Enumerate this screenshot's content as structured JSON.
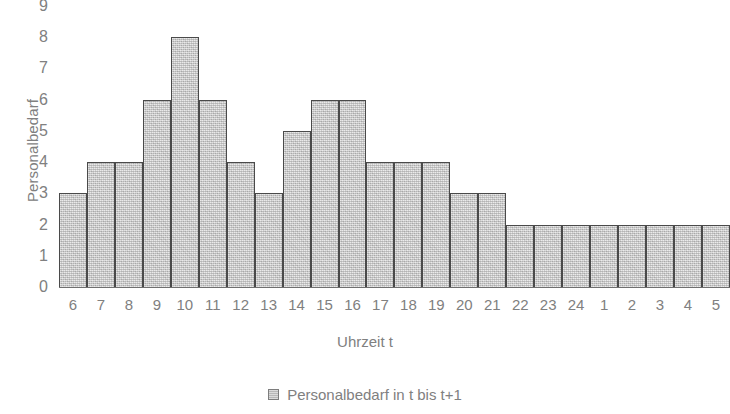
{
  "chart_data": {
    "type": "bar",
    "title": "",
    "xlabel": "Uhrzeit t",
    "ylabel": "Personalbedarf",
    "categories": [
      "6",
      "7",
      "8",
      "9",
      "10",
      "11",
      "12",
      "13",
      "14",
      "15",
      "16",
      "17",
      "18",
      "19",
      "20",
      "21",
      "22",
      "23",
      "24",
      "1",
      "2",
      "3",
      "4",
      "5"
    ],
    "values": [
      3,
      4,
      4,
      6,
      8,
      6,
      4,
      3,
      5,
      6,
      6,
      4,
      4,
      4,
      3,
      3,
      2,
      2,
      2,
      2,
      2,
      2,
      2,
      2
    ],
    "series": [
      {
        "name": "Personalbedarf in t bis t+1",
        "values": [
          3,
          4,
          4,
          6,
          8,
          6,
          4,
          3,
          5,
          6,
          6,
          4,
          4,
          4,
          3,
          3,
          2,
          2,
          2,
          2,
          2,
          2,
          2,
          2
        ]
      }
    ],
    "ylim": [
      0,
      9
    ],
    "yticks": [
      0,
      1,
      2,
      3,
      4,
      5,
      6,
      7,
      8,
      9
    ],
    "ytick_labels": [
      "0",
      "1",
      "2",
      "3",
      "4",
      "5",
      "6",
      "7",
      "8",
      "9"
    ],
    "grid": false,
    "legend": {
      "position": "bottom-center",
      "entries": [
        {
          "label": "Personalbedarf in t bis t+1",
          "color": "#c9c9c9"
        }
      ]
    },
    "bar_gap": 0,
    "colors": {
      "bar_fill": "#c9c9c9",
      "bar_border": "#4a4a4a",
      "text": "#808080",
      "axis_line": "#6f6f6f",
      "background": "#ffffff"
    }
  }
}
